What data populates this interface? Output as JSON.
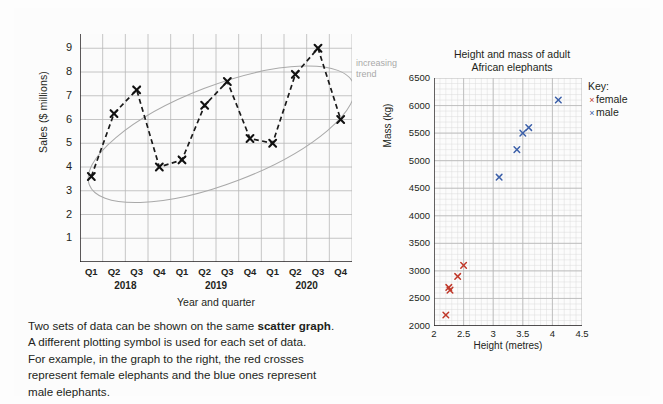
{
  "caption": {
    "line1_a": "Two sets of data can be shown on the same ",
    "line1_b": "scatter graph",
    "line1_c": ".",
    "line2": "A different plotting symbol is used for each set of data.",
    "line3": "For example, in the graph to the right, the red crosses",
    "line4": "represent female elephants and the blue ones represent",
    "line5": "male elephants."
  },
  "colors": {
    "female": "#c0392b",
    "male": "#3b5fa8",
    "grid": "#b8b8b8",
    "axis": "#231f20",
    "trend": "#a9a9a9"
  },
  "chart_data": [
    {
      "type": "line",
      "name": "sales-by-quarter",
      "title": "",
      "xlabel": "Year and quarter",
      "ylabel": "Sales ($ millions)",
      "ylim": [
        0,
        9.6
      ],
      "yticks": [
        1,
        2,
        3,
        4,
        5,
        6,
        7,
        8,
        9
      ],
      "grid": true,
      "annotation": "increasing trend",
      "annotation_line1": "increasing",
      "annotation_line2": "trend",
      "categories": [
        "Q1",
        "Q2",
        "Q3",
        "Q4",
        "Q1",
        "Q2",
        "Q3",
        "Q4",
        "Q1",
        "Q2",
        "Q3",
        "Q4"
      ],
      "group_labels": [
        "2018",
        "2019",
        "2020"
      ],
      "values": [
        3.6,
        6.25,
        7.25,
        4.0,
        4.3,
        6.6,
        7.6,
        5.2,
        5.0,
        7.9,
        9.0,
        6.0
      ],
      "marker": "x",
      "linestyle": "dashed"
    },
    {
      "type": "scatter",
      "name": "elephant-height-mass",
      "title": "Height and mass of adult African elephants",
      "title_line1": "Height and mass of adult",
      "title_line2": "African elephants",
      "xlabel": "Height (metres)",
      "ylabel": "Mass (kg)",
      "xlim": [
        2,
        4.5
      ],
      "ylim": [
        2000,
        6500
      ],
      "xticks": [
        2,
        2.5,
        3,
        3.5,
        4,
        4.5
      ],
      "xtick_labels": [
        "2",
        "2.5",
        "3",
        "3.5",
        "4",
        "4.5"
      ],
      "yticks": [
        2000,
        2500,
        3000,
        3500,
        4000,
        4500,
        5000,
        5500,
        6000,
        6500
      ],
      "grid": true,
      "key_title": "Key:",
      "series": [
        {
          "name": "female",
          "marker": "x",
          "color": "#c0392b",
          "points": [
            [
              2.2,
              2200
            ],
            [
              2.25,
              2700
            ],
            [
              2.27,
              2650
            ],
            [
              2.4,
              2900
            ],
            [
              2.5,
              3100
            ]
          ]
        },
        {
          "name": "male",
          "marker": "x",
          "color": "#3b5fa8",
          "points": [
            [
              3.1,
              4700
            ],
            [
              3.4,
              5200
            ],
            [
              3.5,
              5500
            ],
            [
              3.6,
              5600
            ],
            [
              4.1,
              6100
            ]
          ]
        }
      ]
    }
  ]
}
